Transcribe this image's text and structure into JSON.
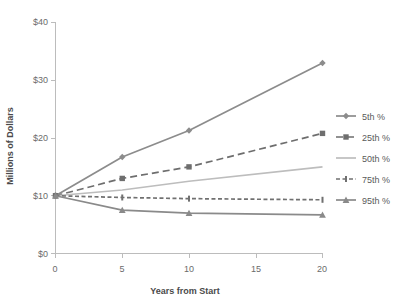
{
  "chart_data": {
    "type": "line",
    "title": "",
    "xlabel": "Years from Start",
    "ylabel": "Millions of Dollars",
    "x": [
      0,
      5,
      10,
      20
    ],
    "xlim": [
      0,
      20
    ],
    "ylim": [
      0,
      40
    ],
    "xticks": [
      "0",
      "5",
      "10",
      "15",
      "20"
    ],
    "xtick_values": [
      0,
      5,
      10,
      15,
      20
    ],
    "yticks": [
      "$0",
      "$10",
      "$20",
      "$30",
      "$40"
    ],
    "ytick_values": [
      0,
      10,
      20,
      30,
      40
    ],
    "grid": false,
    "legend_position": "right",
    "series": [
      {
        "name": "5th %",
        "values": [
          10,
          16.7,
          21.3,
          33.0
        ],
        "color": "#8c8c8c",
        "dash": "none",
        "marker": "diamond"
      },
      {
        "name": "25th %",
        "values": [
          10,
          13.0,
          15.0,
          20.8
        ],
        "color": "#6e6e6e",
        "dash": "dashed",
        "marker": "square"
      },
      {
        "name": "50th %",
        "values": [
          10,
          11.0,
          12.5,
          15.0
        ],
        "color": "#bdbdbd",
        "dash": "none",
        "marker": "none"
      },
      {
        "name": "75th %",
        "values": [
          10,
          9.7,
          9.5,
          9.3
        ],
        "color": "#707070",
        "dash": "dotted-dash",
        "marker": "tick"
      },
      {
        "name": "95th %",
        "values": [
          10,
          7.5,
          7.0,
          6.7
        ],
        "color": "#8a8a8a",
        "dash": "none",
        "marker": "triangle"
      }
    ]
  },
  "legend": {
    "items": [
      {
        "label": "5th %"
      },
      {
        "label": "25th %"
      },
      {
        "label": "50th %"
      },
      {
        "label": "75th %"
      },
      {
        "label": "95th %"
      }
    ]
  },
  "axes": {
    "y_title": "Millions of Dollars",
    "x_title": "Years from Start",
    "y_tick_0": "$0",
    "y_tick_1": "$10",
    "y_tick_2": "$20",
    "y_tick_3": "$30",
    "y_tick_4": "$40",
    "x_tick_0": "0",
    "x_tick_1": "5",
    "x_tick_2": "10",
    "x_tick_3": "15",
    "x_tick_4": "20"
  }
}
